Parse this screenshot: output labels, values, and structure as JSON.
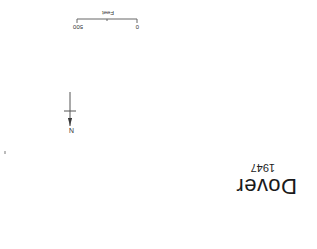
{
  "map": {
    "title": "Dover",
    "year": "1947",
    "orientation": "rotated 180 degrees",
    "north_arrow": {
      "label": "N",
      "icon": "north-arrow-icon"
    },
    "scale_bar": {
      "tick_labels": [
        "0",
        "500"
      ],
      "unit": "Feet"
    }
  },
  "colors": {
    "background": "#ffffff",
    "ink": "#1a1a1a"
  }
}
